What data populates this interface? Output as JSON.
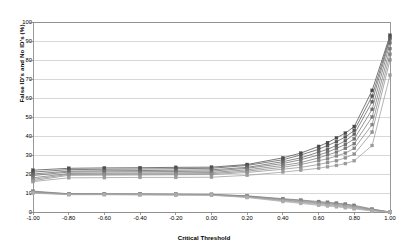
{
  "chart_data": {
    "type": "line",
    "title": "",
    "xlabel": "Critical Threshold",
    "ylabel": "False ID's and No ID's (%)",
    "xlim": [
      -1.0,
      1.0
    ],
    "ylim": [
      0,
      100
    ],
    "grid": "horizontal",
    "legend": "none",
    "marker": "square",
    "x_ticks": [
      "-1.00",
      "-0.80",
      "-0.60",
      "-0.40",
      "-0.20",
      "0.00",
      "0.20",
      "0.40",
      "0.60",
      "0.80",
      "1.00"
    ],
    "y_ticks": [
      "0",
      "10",
      "20",
      "30",
      "40",
      "50",
      "60",
      "70",
      "80",
      "90",
      "100"
    ],
    "x": [
      -1.0,
      -0.8,
      -0.6,
      -0.4,
      -0.2,
      0.0,
      0.2,
      0.4,
      0.5,
      0.6,
      0.65,
      0.7,
      0.75,
      0.8,
      0.9,
      1.0
    ],
    "series": [
      {
        "name": "False ID's 1",
        "group": "false-ids",
        "color": "#4a4a4a",
        "values": [
          22.0,
          23.0,
          23.2,
          23.3,
          23.5,
          23.6,
          25.0,
          28.5,
          31.0,
          34.5,
          36.5,
          39.0,
          41.5,
          45.0,
          64.0,
          93.0
        ]
      },
      {
        "name": "False ID's 2",
        "group": "false-ids",
        "color": "#555555",
        "values": [
          21.0,
          22.3,
          22.5,
          22.6,
          22.8,
          23.0,
          24.5,
          27.5,
          30.0,
          33.0,
          35.0,
          37.0,
          39.5,
          43.0,
          61.0,
          92.0
        ]
      },
      {
        "name": "False ID's 3",
        "group": "false-ids",
        "color": "#626262",
        "values": [
          20.0,
          21.5,
          21.7,
          21.8,
          22.0,
          22.2,
          23.5,
          26.5,
          28.5,
          31.5,
          33.0,
          35.0,
          37.5,
          41.0,
          58.0,
          91.0
        ]
      },
      {
        "name": "False ID's 4",
        "group": "false-ids",
        "color": "#6e6e6e",
        "values": [
          19.2,
          21.0,
          21.1,
          21.2,
          21.3,
          21.5,
          23.0,
          25.5,
          27.5,
          30.0,
          31.5,
          33.5,
          35.5,
          38.5,
          54.0,
          89.0
        ]
      },
      {
        "name": "False ID's 5",
        "group": "false-ids",
        "color": "#787878",
        "values": [
          18.0,
          20.3,
          20.4,
          20.5,
          20.6,
          20.8,
          22.2,
          24.5,
          26.0,
          28.5,
          30.0,
          31.5,
          33.5,
          36.0,
          50.0,
          86.0
        ]
      },
      {
        "name": "False ID's 6",
        "group": "false-ids",
        "color": "#848484",
        "values": [
          17.2,
          19.8,
          19.9,
          20.0,
          20.1,
          20.2,
          21.5,
          23.5,
          25.0,
          27.0,
          28.0,
          29.5,
          31.0,
          33.5,
          46.0,
          83.0
        ]
      },
      {
        "name": "False ID's 7",
        "group": "false-ids",
        "color": "#909090",
        "values": [
          16.5,
          19.3,
          19.4,
          19.5,
          19.6,
          19.7,
          20.8,
          22.5,
          23.5,
          25.0,
          26.0,
          27.0,
          28.5,
          30.5,
          42.0,
          80.0
        ]
      },
      {
        "name": "False ID's 8",
        "group": "false-ids",
        "color": "#9b9b9b",
        "values": [
          16.0,
          18.0,
          18.1,
          18.2,
          18.2,
          18.3,
          19.3,
          21.0,
          22.0,
          23.0,
          23.8,
          24.5,
          25.5,
          27.0,
          35.0,
          72.0
        ]
      },
      {
        "name": "No ID's 1",
        "group": "no-ids",
        "color": "#777777",
        "values": [
          11.0,
          9.6,
          9.5,
          9.5,
          9.4,
          9.3,
          8.5,
          7.0,
          6.3,
          5.5,
          5.1,
          4.7,
          4.2,
          3.5,
          1.6,
          0.0
        ]
      },
      {
        "name": "No ID's 2",
        "group": "no-ids",
        "color": "#828282",
        "values": [
          10.7,
          9.5,
          9.4,
          9.4,
          9.3,
          9.2,
          8.4,
          6.7,
          6.0,
          5.1,
          4.7,
          4.3,
          3.8,
          3.1,
          1.3,
          0.0
        ]
      },
      {
        "name": "No ID's 3",
        "group": "no-ids",
        "color": "#8d8d8d",
        "values": [
          10.5,
          9.4,
          9.4,
          9.3,
          9.2,
          9.1,
          8.2,
          6.4,
          5.6,
          4.7,
          4.3,
          3.9,
          3.4,
          2.7,
          1.1,
          0.0
        ]
      },
      {
        "name": "No ID's 4",
        "group": "no-ids",
        "color": "#979797",
        "values": [
          10.3,
          9.3,
          9.3,
          9.2,
          9.1,
          9.0,
          8.0,
          6.1,
          5.3,
          4.3,
          3.9,
          3.5,
          3.0,
          2.3,
          0.9,
          0.0
        ]
      },
      {
        "name": "No ID's 5",
        "group": "no-ids",
        "color": "#a2a2a2",
        "values": [
          10.1,
          9.2,
          9.2,
          9.1,
          9.0,
          8.9,
          7.8,
          5.8,
          4.9,
          3.9,
          3.5,
          3.1,
          2.6,
          2.0,
          0.7,
          0.0
        ]
      },
      {
        "name": "No ID's 6",
        "group": "no-ids",
        "color": "#adadad",
        "values": [
          9.9,
          9.1,
          9.1,
          9.0,
          8.9,
          8.8,
          7.6,
          5.5,
          4.5,
          3.5,
          3.1,
          2.7,
          2.2,
          1.6,
          0.5,
          0.0
        ]
      }
    ]
  },
  "axes": {
    "x_title": "Critical Threshold",
    "y_title": "False ID's and No ID's (%)"
  },
  "style": {
    "grid_color": "#c8c8c8",
    "axis_color": "#808080",
    "background": "#ffffff",
    "text_color": "#000000"
  }
}
